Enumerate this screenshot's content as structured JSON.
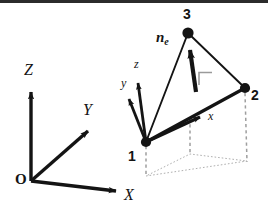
{
  "figure": {
    "background_color": "#ffffff",
    "ink_color": "#141414",
    "projection_color": "#b4b4b4",
    "right_angle_color": "#9a9a9a",
    "global_axes": {
      "origin_label": "O",
      "origin_point": [
        31,
        181
      ],
      "axes": [
        {
          "name": "Z",
          "label": "Z",
          "tip": [
            31,
            88
          ],
          "label_pos": [
            24,
            62
          ]
        },
        {
          "name": "Y",
          "label": "Y",
          "tip": [
            92,
            127
          ],
          "label_pos": [
            83,
            102
          ]
        },
        {
          "name": "X",
          "label": "X",
          "tip": [
            121,
            192
          ],
          "label_pos": [
            125,
            188
          ]
        }
      ]
    },
    "element": {
      "nodes": [
        {
          "id": "1",
          "label": "1",
          "point": [
            146,
            142
          ],
          "label_pos": [
            129,
            149
          ]
        },
        {
          "id": "2",
          "label": "2",
          "point": [
            245,
            88
          ],
          "label_pos": [
            252,
            88
          ]
        },
        {
          "id": "3",
          "label": "3",
          "point": [
            188,
            33
          ],
          "label_pos": [
            184,
            7
          ]
        }
      ],
      "edges": [
        [
          "1",
          "2"
        ],
        [
          "2",
          "3"
        ],
        [
          "3",
          "1"
        ]
      ]
    },
    "local_axes": {
      "origin_point": [
        146,
        142
      ],
      "axes": [
        {
          "name": "x",
          "label": "x",
          "tip": [
            204,
            116
          ],
          "label_pos": [
            209,
            110
          ]
        },
        {
          "name": "y",
          "label": "y",
          "tip": [
            127,
            96
          ],
          "label_pos": [
            124,
            77
          ]
        },
        {
          "name": "z",
          "label": "z",
          "tip": [
            138,
            79
          ],
          "label_pos": [
            136,
            60
          ]
        }
      ]
    },
    "normal_vector": {
      "label": "n",
      "label_subscript": "e",
      "label_pos": [
        156,
        31
      ],
      "tail": [
        195,
        91
      ],
      "tip": [
        189,
        45
      ],
      "right_angle_marker": {
        "x": 199,
        "y": 72,
        "size": 13
      }
    },
    "projection": {
      "shown": true,
      "projected_points": [
        {
          "of": "1",
          "point": [
            146,
            176
          ]
        },
        {
          "of": "2",
          "point": [
            247,
            161
          ]
        },
        {
          "of": "3",
          "point": [
            190,
            154
          ]
        }
      ],
      "drop_lines": [
        {
          "from": "1",
          "to": [
            146,
            176
          ]
        },
        {
          "from": "2",
          "to": [
            247,
            161
          ]
        },
        {
          "from": "3",
          "to": [
            190,
            154
          ]
        }
      ]
    }
  }
}
